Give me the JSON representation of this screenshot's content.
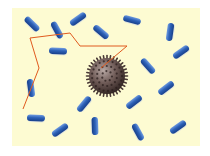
{
  "illustration": {
    "title": "Virus among rod-shaped bacteria",
    "background_color": "#fdfbd2",
    "page_color": "#ffffff",
    "panel": {
      "x": 12,
      "y": 8,
      "width": 188,
      "height": 138
    },
    "path_color": "#e05a1e",
    "path_points": "23,109 39,68 30,38 70,33 80,46 127,46 101,68",
    "bacteria_color": "#2e62b8",
    "bacteria": [
      {
        "cx": 32,
        "cy": 24,
        "angle": 45
      },
      {
        "cx": 57,
        "cy": 30,
        "angle": 62
      },
      {
        "cx": 78,
        "cy": 19,
        "angle": -35
      },
      {
        "cx": 101,
        "cy": 32,
        "angle": 40
      },
      {
        "cx": 58,
        "cy": 51,
        "angle": 3
      },
      {
        "cx": 132,
        "cy": 20,
        "angle": 15
      },
      {
        "cx": 170,
        "cy": 32,
        "angle": -82
      },
      {
        "cx": 181,
        "cy": 52,
        "angle": -35
      },
      {
        "cx": 148,
        "cy": 66,
        "angle": 48
      },
      {
        "cx": 31,
        "cy": 88,
        "angle": 82
      },
      {
        "cx": 36,
        "cy": 118,
        "angle": 2
      },
      {
        "cx": 60,
        "cy": 130,
        "angle": -35
      },
      {
        "cx": 84,
        "cy": 104,
        "angle": -50
      },
      {
        "cx": 95,
        "cy": 126,
        "angle": 88
      },
      {
        "cx": 134,
        "cy": 102,
        "angle": -38
      },
      {
        "cx": 166,
        "cy": 88,
        "angle": -38
      },
      {
        "cx": 138,
        "cy": 132,
        "angle": 62
      },
      {
        "cx": 178,
        "cy": 127,
        "angle": -35
      }
    ],
    "virus": {
      "cx": 107,
      "cy": 76,
      "r": 18,
      "color": "#6e5a56"
    }
  }
}
